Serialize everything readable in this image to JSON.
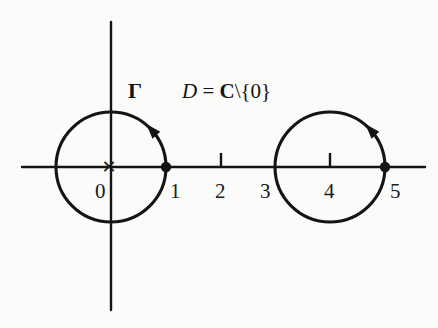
{
  "figure": {
    "background_color": "#fbfbfa",
    "ink_color": "#141414",
    "width": 438,
    "height": 328
  },
  "axes": {
    "x_axis": {
      "name": "real-axis",
      "y_pixel": 167,
      "x_start": 22,
      "x_end": 425,
      "unit_pixels": 54.75,
      "origin_pixel": 111
    },
    "y_axis": {
      "name": "imaginary-axis",
      "x_pixel": 111,
      "y_start": 22,
      "y_end": 310
    },
    "ticks": [
      {
        "value": "0",
        "x": 111,
        "marker": "cross",
        "label_dx": -16,
        "label_dy": 14
      },
      {
        "value": "1",
        "x": 166,
        "marker": "dot",
        "label_dx": 4,
        "label_dy": 14
      },
      {
        "value": "2",
        "x": 221,
        "marker": "tick",
        "label_dx": -6,
        "label_dy": 14
      },
      {
        "value": "3",
        "x": 276,
        "marker": "none",
        "label_dx": -16,
        "label_dy": 14
      },
      {
        "value": "4",
        "x": 330,
        "marker": "tick",
        "label_dx": -6,
        "label_dy": 14
      },
      {
        "value": "5",
        "x": 385,
        "marker": "dot",
        "label_dx": 5,
        "label_dy": 14
      }
    ]
  },
  "contours": [
    {
      "name": "unit-circle-gamma",
      "center_x": 111,
      "center_y": 167,
      "radius": 55,
      "orientation": "counterclockwise",
      "base_point_value": "1",
      "base_point_x": 166,
      "base_point_y": 167,
      "label": "Γ"
    },
    {
      "name": "shifted-circle",
      "center_x": 330,
      "center_y": 167,
      "radius": 55,
      "orientation": "counterclockwise",
      "base_point_value": "5",
      "base_point_x": 385,
      "base_point_y": 167,
      "label": ""
    }
  ],
  "labels": {
    "gamma": {
      "text": "Γ",
      "x": 128,
      "y": 80
    },
    "domain": {
      "symbol": "D",
      "equals": " = ",
      "set": "C",
      "remainder": "\\{0}",
      "full_text": "D = C\\{0}",
      "x": 182,
      "y": 81
    },
    "origin_marker": {
      "name": "puncture-cross",
      "text": "×",
      "x": 111,
      "y": 167
    }
  }
}
